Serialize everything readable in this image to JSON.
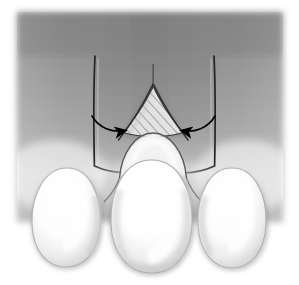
{
  "figure": {
    "domain_kind": "medical-line-illustration",
    "canvas": {
      "width": 299,
      "height": 285,
      "background": "#ffffff"
    },
    "palette": {
      "page_background": "#ffffff",
      "bone_background_dark": "#8f8f8f",
      "bone_background_mid": "#a0a0a0",
      "bone_background_light": "#c8c8c8",
      "socket_shadow": "#7a7a7a",
      "outline_dark": "#2a2a2a",
      "outline_mid": "#6b6b6b",
      "tooth_white": "#ffffff",
      "tooth_shade": "#d9d9d9",
      "tooth_edge": "#9a9a9a",
      "hatch_line": "#6f6f6f",
      "hatch_fill": "#dcdcdc",
      "arrow_color": "#000000"
    },
    "background_block": {
      "name": "bone-background-block",
      "x": 17,
      "y": 12,
      "width": 266,
      "height": 210,
      "edge_softness_px": 6
    },
    "parts": [
      {
        "name": "alveolar-bone-field",
        "label": "Alveolar bone / gingiva background",
        "kind": "gradient-block"
      },
      {
        "name": "socket-wall-left",
        "label": "Left socket wall",
        "kind": "vertical-line",
        "x": 94,
        "y_top": 55,
        "y_bottom": 172
      },
      {
        "name": "socket-wall-right",
        "label": "Right socket wall",
        "kind": "vertical-line",
        "x": 215,
        "y_top": 55,
        "y_bottom": 172
      },
      {
        "name": "socket-floor",
        "label": "Socket floor / crest line",
        "kind": "horizontal-line",
        "y": 168
      },
      {
        "name": "root-apex-line",
        "label": "Root apex guide line",
        "kind": "vertical-line",
        "x": 153,
        "y_top": 64,
        "y_bottom": 86
      },
      {
        "name": "hatched-root-triangle",
        "label": "Hatched (sectioned) root",
        "kind": "hatched-triangle",
        "apex": [
          153,
          86
        ],
        "left_base": [
          122,
          133
        ],
        "right_base": [
          183,
          133
        ],
        "hatch_angle_deg": 42,
        "hatch_spacing_px": 5
      },
      {
        "name": "erupting-crown-dome",
        "label": "Erupting crown dome under root",
        "kind": "dome"
      },
      {
        "name": "tooth-crown-left",
        "label": "Left tooth crown",
        "kind": "tooth",
        "cx": 66,
        "cy": 222
      },
      {
        "name": "tooth-crown-center",
        "label": "Center tooth crown",
        "kind": "tooth",
        "cx": 151,
        "cy": 222
      },
      {
        "name": "tooth-crown-right",
        "label": "Right tooth crown",
        "kind": "tooth",
        "cx": 232,
        "cy": 224
      }
    ],
    "annotations": {
      "arrows": [
        {
          "name": "arrow-left",
          "label": "Left converging pressure arrow",
          "direction": "points-right-inward",
          "tail": [
            93,
            118
          ],
          "head": [
            133,
            130
          ],
          "curve": "concave-up"
        },
        {
          "name": "arrow-right",
          "label": "Right converging pressure arrow",
          "direction": "points-left-inward",
          "tail": [
            214,
            118
          ],
          "head": [
            173,
            130
          ],
          "curve": "concave-up"
        }
      ],
      "arrow_count": 2,
      "arrow_color": "#000000"
    },
    "text_labels": []
  }
}
